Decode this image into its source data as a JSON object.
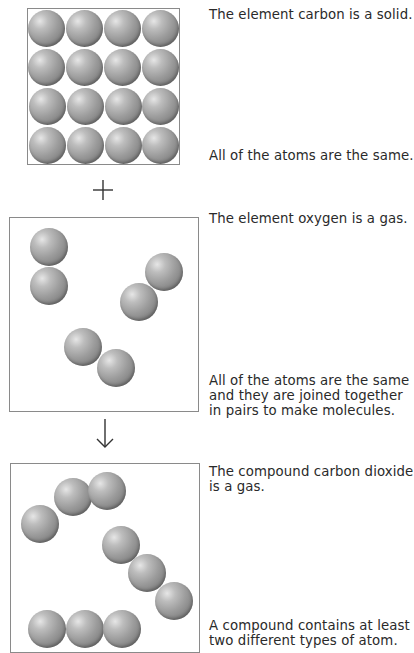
{
  "panels": [
    {
      "id": "carbon",
      "caption_top": "The element carbon is a solid.",
      "caption_bottom": "All of the atoms are the same."
    },
    {
      "id": "oxygen",
      "caption_top": "The element oxygen is a gas.",
      "caption_bottom_lines": [
        "All of the atoms are the same",
        "and they are joined together",
        "in pairs to make molecules."
      ]
    },
    {
      "id": "carbon-dioxide",
      "caption_top_lines": [
        "The compound carbon dioxide",
        "is a gas."
      ],
      "caption_bottom_lines": [
        "A compound contains at least",
        "two different types of atom."
      ]
    }
  ],
  "operators": {
    "plus": "plus-sign",
    "arrow": "down-arrow"
  },
  "colors": {
    "atom": "#9c9c9c",
    "border": "#8a8a8a",
    "text": "#2a2a2a"
  }
}
